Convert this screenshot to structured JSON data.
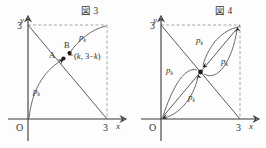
{
  "figure": {
    "kind": "math-diagram-pair",
    "background_color": "#fdfdfd",
    "ink_color": "#3a3a3a",
    "dash_color": "#8d8d8d"
  },
  "panels": [
    {
      "id": "fig3",
      "title": "図 3",
      "axis_x_label": "x",
      "axis_y_label": "y",
      "origin_label": "O",
      "x_tick_label": "3",
      "y_tick_label": "3",
      "points": [
        {
          "name": "A",
          "label": "A"
        },
        {
          "name": "B",
          "label": "B"
        }
      ],
      "coordinate_label": "(k, 3−k)",
      "coordinate_label_parts": {
        "open": "(",
        "x": "k",
        "comma": ", 3−",
        "y": "k",
        "close": ")"
      },
      "curve_labels": [
        {
          "base": "p",
          "sub": "k"
        },
        {
          "base": "p",
          "sub": "k"
        }
      ]
    },
    {
      "id": "fig4",
      "title": "図 4",
      "axis_x_label": "x",
      "axis_y_label": "y",
      "origin_label": "O",
      "x_tick_label": "3",
      "y_tick_label": "3",
      "curve_labels": [
        {
          "base": "p",
          "sub": "k"
        },
        {
          "base": "p",
          "sub": "k"
        },
        {
          "base": "p",
          "sub": "k"
        },
        {
          "base": "p",
          "sub": "k"
        }
      ]
    }
  ]
}
